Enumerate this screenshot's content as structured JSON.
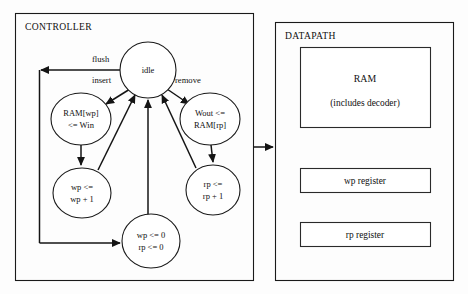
{
  "figure": {
    "background_color": "#fdfdfd",
    "line_color": "#141414",
    "text_color": "#101010"
  },
  "controller": {
    "title": "CONTROLLER",
    "states": [
      {
        "id": "idle",
        "label_lines": [
          "idle"
        ],
        "cx": 148,
        "cy": 70,
        "rx": 28,
        "ry": 28
      },
      {
        "id": "ram-write",
        "label_lines": [
          "RAM[wp]",
          "<= Win"
        ],
        "cx": 81,
        "cy": 119,
        "rx": 30,
        "ry": 26
      },
      {
        "id": "wout-read",
        "label_lines": [
          "Wout <=",
          "RAM[rp]"
        ],
        "cx": 210,
        "cy": 119,
        "rx": 30,
        "ry": 26
      },
      {
        "id": "wp-incr",
        "label_lines": [
          "wp <=",
          "wp + 1"
        ],
        "cx": 82,
        "cy": 193,
        "rx": 29,
        "ry": 25
      },
      {
        "id": "rp-incr",
        "label_lines": [
          "rp <=",
          "rp + 1"
        ],
        "cx": 213,
        "cy": 190,
        "rx": 27,
        "ry": 25
      },
      {
        "id": "reset-ptrs",
        "label_lines": [
          "wp <= 0",
          "rp <= 0"
        ],
        "cx": 151,
        "cy": 241,
        "rx": 29,
        "ry": 27
      }
    ],
    "edge_labels": [
      {
        "id": "flush",
        "text": "flush",
        "x": 92,
        "y": 62
      },
      {
        "id": "insert",
        "text": "insert",
        "x": 92,
        "y": 83
      },
      {
        "id": "remove",
        "text": "remove",
        "x": 175,
        "y": 83
      }
    ]
  },
  "datapath": {
    "title": "DATAPATH",
    "blocks": [
      {
        "id": "ram",
        "label_lines": [
          "RAM",
          "(includes decoder)"
        ],
        "x": 300,
        "y": 47,
        "w": 130,
        "h": 80
      },
      {
        "id": "wp-register",
        "label_lines": [
          "wp register"
        ],
        "x": 300,
        "y": 168,
        "w": 130,
        "h": 24
      },
      {
        "id": "rp-register",
        "label_lines": [
          "rp register"
        ],
        "x": 300,
        "y": 222,
        "w": 130,
        "h": 24
      }
    ]
  }
}
